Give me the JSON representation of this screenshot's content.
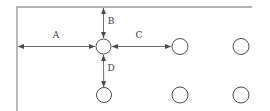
{
  "diagram": {
    "type": "engineering-dimension-drawing",
    "canvas": {
      "width": 270,
      "height": 111
    },
    "colors": {
      "background": "#ffffff",
      "datum_line": "#9a9a9a",
      "dimension_line": "#4a4a4a",
      "circle_stroke": "#4a4a4a",
      "circle_fill": "#ffffff",
      "label_text": "#3a3a3a"
    },
    "datum": {
      "vertical_line": {
        "x": 17,
        "y1": 6,
        "y2": 111
      },
      "horizontal_line": {
        "y": 7,
        "x1": 17,
        "x2": 252
      }
    },
    "holes": [
      {
        "id": "hole-center",
        "label": "",
        "cx": 103.5,
        "cy": 46.5,
        "r": 7.5,
        "row": "middle",
        "col": 1
      },
      {
        "id": "hole-middle-2",
        "label": "",
        "cx": 180,
        "cy": 46.5,
        "r": 8,
        "row": "middle",
        "col": 2
      },
      {
        "id": "hole-middle-3",
        "label": "",
        "cx": 241,
        "cy": 46.5,
        "r": 8,
        "row": "middle",
        "col": 3
      },
      {
        "id": "hole-bottom-1",
        "label": "",
        "cx": 104,
        "cy": 95,
        "r": 7.5,
        "row": "bottom",
        "col": 1
      },
      {
        "id": "hole-bottom-2",
        "label": "",
        "cx": 180,
        "cy": 95,
        "r": 8,
        "row": "bottom",
        "col": 2
      },
      {
        "id": "hole-bottom-3",
        "label": "",
        "cx": 241,
        "cy": 95,
        "r": 8,
        "row": "bottom",
        "col": 3
      }
    ],
    "dimensions": [
      {
        "id": "dim-a",
        "label": "A",
        "orientation": "horizontal",
        "description": "distance from left datum edge to center hole",
        "from": {
          "x": 18,
          "y": 46.5
        },
        "to": {
          "x": 95,
          "y": 46.5
        },
        "label_pos": {
          "x": 56,
          "y": 35
        }
      },
      {
        "id": "dim-b",
        "label": "B",
        "orientation": "vertical",
        "description": "distance from top datum edge to center hole",
        "from": {
          "x": 103.5,
          "y": 8
        },
        "to": {
          "x": 103.5,
          "y": 38
        },
        "label_pos": {
          "x": 111,
          "y": 21
        }
      },
      {
        "id": "dim-c",
        "label": "C",
        "orientation": "horizontal",
        "description": "center-to-center hole pitch in middle row",
        "from": {
          "x": 112,
          "y": 46.5
        },
        "to": {
          "x": 171,
          "y": 46.5
        },
        "label_pos": {
          "x": 139,
          "y": 35
        }
      },
      {
        "id": "dim-d",
        "label": "D",
        "orientation": "vertical",
        "description": "center-to-center hole pitch between rows",
        "from": {
          "x": 103.5,
          "y": 55
        },
        "to": {
          "x": 103.7,
          "y": 87
        },
        "label_pos": {
          "x": 111,
          "y": 68
        }
      }
    ]
  }
}
